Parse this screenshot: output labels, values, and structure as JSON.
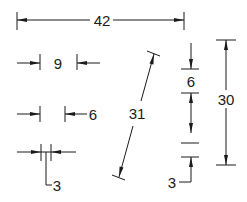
{
  "diagram": {
    "type": "dimension-annotation-styles",
    "colors": {
      "line": "#1a1a1a",
      "background": "#ffffff"
    },
    "dimensions": [
      {
        "id": "horizontal-overall",
        "label": "42",
        "orientation": "horizontal",
        "style": "arrows-inside"
      },
      {
        "id": "horizontal-small-arrows-outside",
        "label": "9",
        "orientation": "horizontal",
        "style": "arrows-outside-text-inside"
      },
      {
        "id": "horizontal-arrows-outside-text-right",
        "label": "6",
        "orientation": "horizontal",
        "style": "arrows-outside-text-outside"
      },
      {
        "id": "horizontal-tiny-leader",
        "label": "3",
        "orientation": "horizontal",
        "style": "arrows-outside-leader-text"
      },
      {
        "id": "aligned-oblique",
        "label": "31",
        "orientation": "aligned",
        "style": "arrows-inside"
      },
      {
        "id": "vertical-arrows-outside",
        "label": "6",
        "orientation": "vertical",
        "style": "arrows-outside-text-inside"
      },
      {
        "id": "vertical-overall",
        "label": "30",
        "orientation": "vertical",
        "style": "arrows-inside"
      },
      {
        "id": "vertical-tiny-leader",
        "label": "3",
        "orientation": "vertical",
        "style": "arrows-outside-leader-text"
      }
    ]
  }
}
